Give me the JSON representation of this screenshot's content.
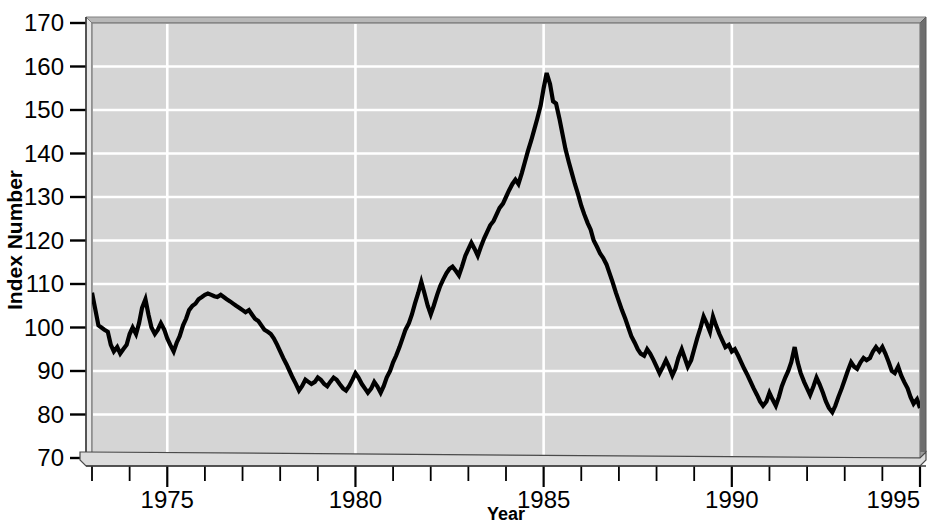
{
  "chart_data": {
    "type": "line",
    "title": "",
    "xlabel": "Year",
    "ylabel": "Index Number",
    "xlim": [
      1973,
      1995
    ],
    "ylim": [
      70,
      170
    ],
    "yticks": [
      70,
      80,
      90,
      100,
      110,
      120,
      130,
      140,
      150,
      160,
      170
    ],
    "xticks_major": [
      1975,
      1980,
      1985,
      1990,
      1995
    ],
    "xticks_minor_step": 1,
    "grid": "white gridlines at major x ticks and every 10 y units",
    "legend": "none",
    "plot_background": "#d5d5d5",
    "line_color": "#000000",
    "series": [
      {
        "name": "Index Number",
        "x": [
          1973.0,
          1973.08,
          1973.17,
          1973.25,
          1973.33,
          1973.42,
          1973.5,
          1973.58,
          1973.67,
          1973.75,
          1973.83,
          1973.92,
          1974.0,
          1974.08,
          1974.17,
          1974.25,
          1974.33,
          1974.42,
          1974.5,
          1974.58,
          1974.67,
          1974.75,
          1974.83,
          1974.92,
          1975.0,
          1975.08,
          1975.17,
          1975.25,
          1975.33,
          1975.42,
          1975.5,
          1975.58,
          1975.67,
          1975.75,
          1975.83,
          1975.92,
          1976.0,
          1976.08,
          1976.17,
          1976.25,
          1976.33,
          1976.42,
          1976.5,
          1976.58,
          1976.67,
          1976.75,
          1976.83,
          1976.92,
          1977.0,
          1977.08,
          1977.17,
          1977.25,
          1977.33,
          1977.42,
          1977.5,
          1977.58,
          1977.67,
          1977.75,
          1977.83,
          1977.92,
          1978.0,
          1978.08,
          1978.17,
          1978.25,
          1978.33,
          1978.42,
          1978.5,
          1978.58,
          1978.67,
          1978.75,
          1978.83,
          1978.92,
          1979.0,
          1979.08,
          1979.17,
          1979.25,
          1979.33,
          1979.42,
          1979.5,
          1979.58,
          1979.67,
          1979.75,
          1979.83,
          1979.92,
          1980.0,
          1980.08,
          1980.17,
          1980.25,
          1980.33,
          1980.42,
          1980.5,
          1980.58,
          1980.67,
          1980.75,
          1980.83,
          1980.92,
          1981.0,
          1981.08,
          1981.17,
          1981.25,
          1981.33,
          1981.42,
          1981.5,
          1981.58,
          1981.67,
          1981.75,
          1981.83,
          1981.92,
          1982.0,
          1982.08,
          1982.17,
          1982.25,
          1982.33,
          1982.42,
          1982.5,
          1982.58,
          1982.67,
          1982.75,
          1982.83,
          1982.92,
          1983.0,
          1983.08,
          1983.17,
          1983.25,
          1983.33,
          1983.42,
          1983.5,
          1983.58,
          1983.67,
          1983.75,
          1983.83,
          1983.92,
          1984.0,
          1984.08,
          1984.17,
          1984.25,
          1984.33,
          1984.42,
          1984.5,
          1984.58,
          1984.67,
          1984.75,
          1984.83,
          1984.92,
          1985.0,
          1985.08,
          1985.17,
          1985.25,
          1985.33,
          1985.42,
          1985.5,
          1985.58,
          1985.67,
          1985.75,
          1985.83,
          1985.92,
          1986.0,
          1986.08,
          1986.17,
          1986.25,
          1986.33,
          1986.42,
          1986.5,
          1986.58,
          1986.67,
          1986.75,
          1986.83,
          1986.92,
          1987.0,
          1987.08,
          1987.17,
          1987.25,
          1987.33,
          1987.42,
          1987.5,
          1987.58,
          1987.67,
          1987.75,
          1987.83,
          1987.92,
          1988.0,
          1988.08,
          1988.17,
          1988.25,
          1988.33,
          1988.42,
          1988.5,
          1988.58,
          1988.67,
          1988.75,
          1988.83,
          1988.92,
          1989.0,
          1989.08,
          1989.17,
          1989.25,
          1989.33,
          1989.42,
          1989.5,
          1989.58,
          1989.67,
          1989.75,
          1989.83,
          1989.92,
          1990.0,
          1990.08,
          1990.17,
          1990.25,
          1990.33,
          1990.42,
          1990.5,
          1990.58,
          1990.67,
          1990.75,
          1990.83,
          1990.92,
          1991.0,
          1991.08,
          1991.17,
          1991.25,
          1991.33,
          1991.42,
          1991.5,
          1991.58,
          1991.67,
          1991.75,
          1991.83,
          1991.92,
          1992.0,
          1992.08,
          1992.17,
          1992.25,
          1992.33,
          1992.42,
          1992.5,
          1992.58,
          1992.67,
          1992.75,
          1992.83,
          1992.92,
          1993.0,
          1993.08,
          1993.17,
          1993.25,
          1993.33,
          1993.42,
          1993.5,
          1993.58,
          1993.67,
          1993.75,
          1993.83,
          1993.92,
          1994.0,
          1994.08,
          1994.17,
          1994.25,
          1994.33,
          1994.42,
          1994.5,
          1994.58,
          1994.67,
          1994.75,
          1994.83,
          1994.92,
          1995.0
        ],
        "values": [
          108.0,
          104.5,
          100.5,
          100.0,
          99.5,
          99.0,
          96.0,
          94.5,
          95.5,
          94.0,
          95.0,
          96.0,
          98.5,
          100.0,
          98.5,
          101.0,
          104.5,
          106.5,
          103.0,
          100.0,
          98.5,
          99.5,
          101.0,
          99.5,
          97.5,
          96.0,
          94.5,
          96.5,
          98.0,
          100.5,
          102.0,
          104.0,
          105.0,
          105.5,
          106.5,
          107.0,
          107.5,
          107.8,
          107.5,
          107.2,
          107.0,
          107.5,
          107.0,
          106.5,
          106.0,
          105.5,
          105.0,
          104.5,
          104.0,
          103.5,
          104.0,
          103.0,
          102.0,
          101.5,
          100.5,
          99.5,
          99.0,
          98.5,
          97.5,
          96.0,
          94.5,
          93.0,
          91.5,
          90.0,
          88.5,
          87.0,
          85.5,
          86.5,
          88.0,
          87.5,
          87.0,
          87.5,
          88.5,
          88.0,
          87.0,
          86.5,
          87.5,
          88.5,
          88.0,
          87.0,
          86.0,
          85.5,
          86.5,
          88.0,
          89.5,
          88.5,
          87.0,
          86.0,
          85.0,
          86.0,
          87.5,
          86.5,
          85.0,
          86.5,
          88.5,
          90.0,
          92.0,
          93.5,
          95.5,
          97.5,
          99.5,
          101.0,
          103.0,
          105.5,
          108.0,
          110.5,
          108.0,
          105.0,
          103.0,
          105.0,
          107.5,
          109.5,
          111.0,
          112.5,
          113.5,
          114.0,
          113.0,
          112.0,
          114.0,
          116.5,
          118.0,
          119.5,
          118.0,
          116.5,
          118.5,
          120.5,
          122.0,
          123.5,
          124.5,
          126.0,
          127.5,
          128.5,
          130.0,
          131.5,
          133.0,
          134.0,
          133.0,
          135.5,
          138.0,
          140.5,
          143.0,
          145.5,
          148.0,
          151.0,
          155.0,
          158.5,
          156.0,
          152.0,
          151.5,
          148.0,
          144.5,
          141.0,
          138.0,
          135.5,
          133.0,
          130.5,
          128.0,
          126.0,
          124.0,
          122.5,
          120.0,
          118.5,
          117.0,
          116.0,
          114.5,
          112.5,
          110.5,
          108.0,
          106.0,
          104.0,
          102.0,
          100.0,
          98.0,
          96.5,
          95.0,
          94.0,
          93.5,
          95.0,
          94.0,
          92.5,
          91.0,
          89.5,
          91.0,
          92.5,
          91.0,
          89.0,
          90.5,
          93.0,
          95.0,
          93.0,
          91.0,
          92.5,
          95.0,
          97.5,
          100.0,
          102.5,
          101.0,
          99.0,
          102.5,
          100.5,
          98.5,
          97.0,
          95.5,
          96.0,
          94.5,
          95.0,
          93.5,
          92.0,
          90.5,
          89.0,
          87.5,
          86.0,
          84.5,
          83.0,
          82.0,
          83.0,
          85.0,
          83.5,
          82.0,
          84.0,
          86.5,
          88.5,
          90.0,
          92.0,
          95.5,
          92.0,
          89.5,
          87.5,
          86.0,
          84.5,
          86.5,
          88.5,
          87.0,
          85.0,
          83.0,
          81.5,
          80.5,
          82.0,
          84.0,
          86.0,
          88.0,
          90.0,
          92.0,
          91.0,
          90.5,
          92.0,
          93.0,
          92.5,
          93.0,
          94.5,
          95.5,
          94.5,
          95.5,
          94.0,
          92.0,
          90.0,
          89.5,
          91.0,
          89.0,
          87.5,
          86.0,
          84.0,
          82.5,
          83.5,
          81.5
        ]
      }
    ]
  },
  "axis": {
    "y_tick_labels": [
      "170",
      "160",
      "150",
      "140",
      "130",
      "120",
      "110",
      "100",
      "90",
      "80",
      "70"
    ],
    "x_tick_labels": [
      "1975",
      "1980",
      "1985",
      "1990",
      "1995"
    ],
    "y_title": "Index Number",
    "x_title": "Year"
  }
}
